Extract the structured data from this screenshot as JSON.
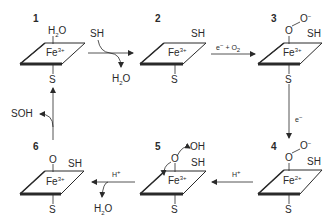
{
  "diagram": {
    "title": "",
    "states": [
      {
        "id": "1",
        "iron": "Fe",
        "charge": "3+",
        "axial_top": "H2O",
        "axial_top_main": "H",
        "axial_top_sub": "2",
        "axial_top_tail": "O",
        "axial_bottom": "S",
        "side": ""
      },
      {
        "id": "2",
        "iron": "Fe",
        "charge": "3+",
        "axial_top": "",
        "axial_bottom": "S",
        "side": "SH"
      },
      {
        "id": "3",
        "iron": "Fe",
        "charge": "3+",
        "axial_top": "O",
        "peroxo": "O",
        "peroxo_charge": "−",
        "axial_bottom": "S",
        "side": "SH"
      },
      {
        "id": "4",
        "iron": "Fe",
        "charge": "2+",
        "axial_top": "O",
        "peroxo": "O",
        "peroxo_charge": "−",
        "axial_bottom": "S",
        "side": "SH"
      },
      {
        "id": "5",
        "iron": "Fe",
        "charge": "3+",
        "axial_top": "O",
        "leaving": "OH",
        "axial_bottom": "S",
        "side": "SH"
      },
      {
        "id": "6",
        "iron": "Fe",
        "charge": "3+",
        "axial_top": "O",
        "axial_bottom": "S",
        "side": "SH"
      }
    ],
    "steps": [
      {
        "from": "1",
        "to": "2",
        "reagent_in": "SH",
        "product_out_main": "H",
        "product_out_sub": "2",
        "product_out_tail": "O"
      },
      {
        "from": "2",
        "to": "3",
        "label_e": "e",
        "label_e_charge": "−",
        "label_plus": "+ O",
        "label_o2_sub": "2"
      },
      {
        "from": "3",
        "to": "4",
        "label_e": "e",
        "label_e_charge": "−"
      },
      {
        "from": "4",
        "to": "5",
        "label": "H",
        "label_charge": "+"
      },
      {
        "from": "5",
        "to": "6",
        "label": "H",
        "label_charge": "+",
        "product_out_main": "H",
        "product_out_sub": "2",
        "product_out_tail": "O"
      },
      {
        "from": "6",
        "to": "1",
        "product_out": "SOH"
      }
    ],
    "colors": {
      "line": "#2a2a2a",
      "background": "#ffffff"
    }
  }
}
